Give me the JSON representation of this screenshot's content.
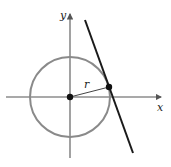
{
  "diagram": {
    "labels": {
      "y_axis": "y",
      "x_axis": "x",
      "radius": "r"
    },
    "colors": {
      "axes": "#555555",
      "circle": "#8a8a8a",
      "tangent_line": "#1a1a1a",
      "points": "#111111"
    }
  }
}
